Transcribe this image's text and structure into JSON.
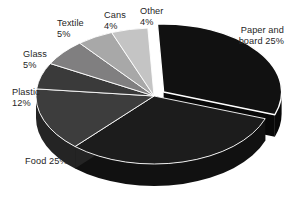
{
  "chart_data": {
    "type": "pie",
    "title": "",
    "subtitle": "",
    "xlabel": "",
    "ylabel": "",
    "style": "exploded-3d",
    "legend_position": "none",
    "grid": false,
    "units": "percent",
    "categories": [
      "Paper and board",
      "Food",
      "Plastic",
      "Glass",
      "Textile",
      "Cans",
      "Other"
    ],
    "values": [
      25,
      25,
      12,
      5,
      5,
      4,
      4
    ],
    "slices": [
      {
        "name": "Paper and board",
        "value": 25,
        "label_line1": "Paper and",
        "label_line2": "board 25%",
        "color": "#111111",
        "side_color": "#080808",
        "exploded": true
      },
      {
        "name": "Food",
        "value": 25,
        "label_line1": "Food 25%",
        "label_line2": "",
        "color": "#1c1c1c",
        "side_color": "#111111",
        "exploded": false
      },
      {
        "name": "Plastic",
        "value": 12,
        "label_line1": "Plastic",
        "label_line2": "12%",
        "color": "#3d3d3d",
        "side_color": "#242424",
        "exploded": false
      },
      {
        "name": "Glass",
        "value": 5,
        "label_line1": "Glass",
        "label_line2": "5%",
        "color": "#3a3a3a",
        "side_color": "#222222",
        "exploded": false
      },
      {
        "name": "Textile",
        "value": 5,
        "label_line1": "Textile",
        "label_line2": "5%",
        "color": "#807f80",
        "side_color": "#5a5a5a",
        "exploded": false
      },
      {
        "name": "Cans",
        "value": 4,
        "label_line1": "Cans",
        "label_line2": "4%",
        "color": "#a8a8a8",
        "side_color": "#7c7c7c",
        "exploded": false
      },
      {
        "name": "Other",
        "value": 4,
        "label_line1": "Other",
        "label_line2": "4%",
        "color": "#c4c4c4",
        "side_color": "#989898",
        "exploded": false
      }
    ],
    "colors": {
      "background": "#ffffff",
      "label_text": "#262626"
    }
  }
}
